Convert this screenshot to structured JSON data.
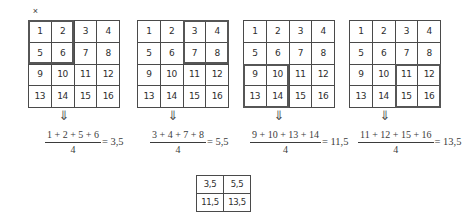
{
  "close_mark": "×",
  "grids": {
    "rows": 4,
    "cols": 4,
    "numbers": [
      [
        "1",
        "2",
        "3",
        "4"
      ],
      [
        "5",
        "6",
        "7",
        "8"
      ],
      [
        "9",
        "10",
        "11",
        "12"
      ],
      [
        "13",
        "14",
        "15",
        "16"
      ]
    ],
    "panels": [
      {
        "id": "grid-1",
        "highlight": "top-left",
        "highlight_values": [
          1,
          2,
          5,
          6
        ],
        "left_px": 28
      },
      {
        "id": "grid-2",
        "highlight": "top-right",
        "highlight_values": [
          3,
          4,
          7,
          8
        ],
        "left_px": 137
      },
      {
        "id": "grid-3",
        "highlight": "bottom-left",
        "highlight_values": [
          9,
          10,
          13,
          14
        ],
        "left_px": 243
      },
      {
        "id": "grid-4",
        "highlight": "bottom-right",
        "highlight_values": [
          11,
          12,
          15,
          16
        ],
        "left_px": 349
      }
    ]
  },
  "arrows": {
    "glyph": "⇓",
    "positions_px": [
      64,
      173,
      279,
      385
    ],
    "count": 4
  },
  "formulas": [
    {
      "numerator": "1 + 2 + 5 + 6",
      "denominator": "4",
      "result": "= 3,5",
      "left_px": 45
    },
    {
      "numerator": "3 + 4 + 7 + 8",
      "denominator": "4",
      "result": "= 5,5",
      "left_px": 150
    },
    {
      "numerator": "9 + 10 + 13 + 14",
      "denominator": "4",
      "result": "= 11,5",
      "left_px": 250
    },
    {
      "numerator": "11 + 12 + 15 + 16",
      "denominator": "4",
      "result": "= 13,5",
      "left_px": 358
    }
  ],
  "result_table": {
    "rows": [
      [
        "3,5",
        "5,5"
      ],
      [
        "11,5",
        "13,5"
      ]
    ]
  },
  "colors": {
    "ink": "#2e2e2e",
    "rule": "#4a4a4a",
    "highlight": "#565656",
    "background": "#ffffff"
  }
}
